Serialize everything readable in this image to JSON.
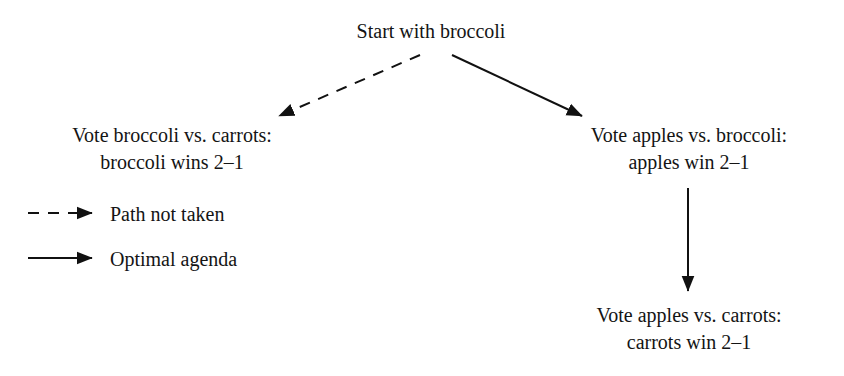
{
  "diagram": {
    "title_node": {
      "name": "start-node",
      "lines": [
        "Start with broccoli"
      ],
      "x": 431,
      "y": 18
    },
    "nodes": [
      {
        "name": "left-vote-node",
        "lines": [
          "Vote broccoli vs. carrots:",
          "broccoli wins 2–1"
        ],
        "x": 172,
        "y": 122
      },
      {
        "name": "right-vote-node",
        "lines": [
          "Vote apples vs. broccoli:",
          "apples win 2–1"
        ],
        "x": 689,
        "y": 122
      },
      {
        "name": "bottom-vote-node",
        "lines": [
          "Vote apples vs. carrots:",
          "carrots win 2–1"
        ],
        "x": 689,
        "y": 302
      }
    ],
    "edges": [
      {
        "name": "edge-start-to-left",
        "style": "dashed",
        "from_x": 420,
        "from_y": 55,
        "to_x": 279,
        "to_y": 116
      },
      {
        "name": "edge-start-to-right",
        "style": "solid",
        "from_x": 452,
        "from_y": 55,
        "to_x": 582,
        "to_y": 116
      },
      {
        "name": "edge-right-to-bottom",
        "style": "solid",
        "from_x": 688,
        "from_y": 188,
        "to_x": 688,
        "to_y": 291
      }
    ],
    "legend": {
      "name": "legend",
      "items": [
        {
          "name": "legend-path-not-taken",
          "style": "dashed",
          "label": "Path not taken",
          "line_x1": 28,
          "line_x2": 92,
          "line_y": 213,
          "label_x": 110,
          "label_y": 202
        },
        {
          "name": "legend-optimal-agenda",
          "style": "solid",
          "label": "Optimal agenda",
          "line_x1": 28,
          "line_x2": 92,
          "line_y": 258,
          "label_x": 110,
          "label_y": 247
        }
      ]
    },
    "colors": {
      "background": "#ffffff",
      "stroke": "#111111",
      "text": "#141414"
    }
  }
}
